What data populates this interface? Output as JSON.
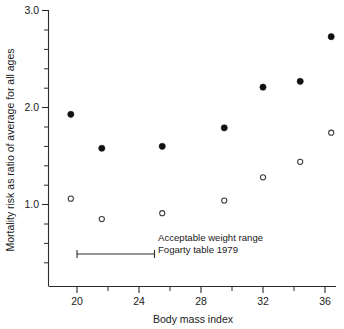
{
  "chart_data": {
    "type": "scatter",
    "title": "",
    "xlabel": "Body mass index",
    "ylabel": "Mortality risk as ratio of average for all ages",
    "xlim": [
      18.4,
      37.2
    ],
    "ylim": [
      0.35,
      3.0
    ],
    "grid": false,
    "legend_position": "none",
    "x_ticks": [
      20,
      24,
      28,
      32,
      36
    ],
    "x_ticklabels": [
      "20",
      "24",
      "28",
      "32",
      "36"
    ],
    "x_minor_ticks": [
      22,
      26,
      30,
      34
    ],
    "y_ticks": [
      1.0,
      2.0,
      3.0
    ],
    "y_ticklabels": [
      "1.0",
      "2.0",
      "3.0"
    ],
    "y_minor_ticks": [
      0.4,
      0.6,
      0.8,
      1.2,
      1.4,
      1.6,
      1.8,
      2.2,
      2.4,
      2.6,
      2.8
    ],
    "series": [
      {
        "name": "filled-circles",
        "marker": "filled-circle",
        "color": "#111111",
        "x": [
          19.6,
          21.6,
          25.5,
          29.5,
          32.0,
          34.4,
          36.4
        ],
        "y": [
          1.93,
          1.58,
          1.6,
          1.79,
          2.21,
          2.27,
          2.73
        ]
      },
      {
        "name": "open-circles",
        "marker": "open-circle",
        "color": "#3a3a3a",
        "x": [
          19.6,
          21.6,
          25.5,
          29.5,
          32.0,
          34.4,
          36.4
        ],
        "y": [
          1.06,
          0.85,
          0.91,
          1.04,
          1.28,
          1.44,
          1.74
        ]
      }
    ],
    "annotations": [
      {
        "name": "acceptable-weight-range",
        "line1": "Acceptable weight range",
        "line2": "Fogarty table 1979",
        "bar_x_start": 20.0,
        "bar_x_end": 25.0,
        "bar_y": 0.49
      }
    ]
  },
  "axes": {
    "x_title": "Body mass index",
    "y_title": "Mortality risk as ratio of average for all ages"
  }
}
